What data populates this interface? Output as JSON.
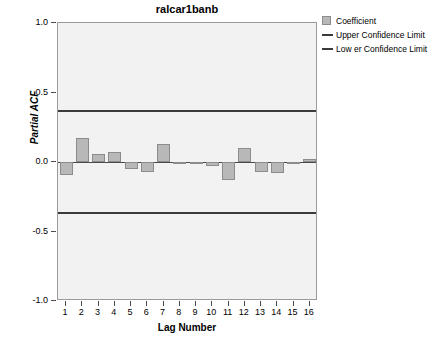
{
  "chart_data": {
    "type": "bar",
    "title": "ralcar1banb",
    "xlabel": "Lag Number",
    "ylabel": "Partial ACF",
    "categories": [
      1,
      2,
      3,
      4,
      5,
      6,
      7,
      8,
      9,
      10,
      11,
      12,
      13,
      14,
      15,
      16
    ],
    "values": [
      -0.09,
      0.17,
      0.06,
      0.07,
      -0.05,
      -0.07,
      0.13,
      -0.01,
      0.0,
      -0.03,
      -0.13,
      0.1,
      -0.07,
      -0.08,
      -0.01,
      0.02
    ],
    "series": [
      {
        "name": "Coefficient",
        "values": [
          -0.09,
          0.17,
          0.06,
          0.07,
          -0.05,
          -0.07,
          0.13,
          -0.01,
          0.0,
          -0.03,
          -0.13,
          0.1,
          -0.07,
          -0.08,
          -0.01,
          0.02
        ]
      }
    ],
    "ylim": [
      -1.0,
      1.0
    ],
    "yticks": [
      1.0,
      0.5,
      0.0,
      -0.5,
      -1.0
    ],
    "ytick_labels": [
      "1.0",
      "0.5",
      "0.0",
      "-0.5",
      "-1.0"
    ],
    "xlim": [
      0.5,
      16.5
    ],
    "grid": false,
    "legend_position": "right-top",
    "upper_confidence_limit": 0.366,
    "lower_confidence_limit": -0.366,
    "bar_color": "#b8b8b8",
    "bar_border_color": "#8c8c8c",
    "line_color": "#3b3b3b",
    "plot_background": "#f2f2f2"
  },
  "legend": {
    "items": [
      {
        "label": "Coefficient",
        "marker": "square-swatch"
      },
      {
        "label": "Upper Confidence Limit",
        "marker": "line-swatch"
      },
      {
        "label": "Low er Confidence Limit",
        "marker": "line-swatch"
      }
    ]
  }
}
